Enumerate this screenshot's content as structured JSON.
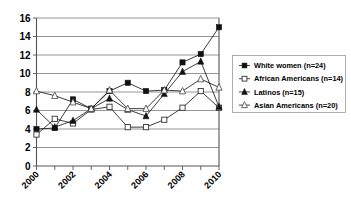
{
  "chart_data": {
    "type": "line",
    "title": "",
    "xlabel": "",
    "ylabel": "",
    "xlim": [
      2000,
      2010
    ],
    "ylim": [
      0,
      16
    ],
    "ytick_values": [
      0,
      2,
      4,
      6,
      8,
      10,
      12,
      14,
      16
    ],
    "ytick_labels": [
      "0",
      "2",
      "4",
      "6",
      "8",
      "10",
      "12",
      "14",
      "16"
    ],
    "x": [
      2000,
      2001,
      2002,
      2003,
      2004,
      2005,
      2006,
      2007,
      2008,
      2009,
      2010
    ],
    "xtick_labels": [
      "2000",
      "2002",
      "2004",
      "2006",
      "2008",
      "2010"
    ],
    "xtick_label_values": [
      2000,
      2002,
      2004,
      2006,
      2008,
      2010
    ],
    "grid": true,
    "legend_position": "right",
    "series": [
      {
        "name": "White women (n=24)",
        "marker": "filled-square",
        "values": [
          4.0,
          4.1,
          7.2,
          6.2,
          8.1,
          9.0,
          8.1,
          8.2,
          11.2,
          12.1,
          15.0
        ]
      },
      {
        "name": "African Americans (n=14)",
        "marker": "open-circle",
        "values": [
          3.4,
          5.1,
          4.6,
          6.1,
          6.4,
          4.2,
          4.2,
          5.0,
          6.3,
          8.1,
          6.3
        ]
      },
      {
        "name": "Latinos (n=15)",
        "marker": "filled-triangle",
        "values": [
          6.1,
          4.2,
          4.9,
          6.2,
          7.3,
          6.1,
          5.4,
          7.8,
          10.2,
          11.3,
          6.4
        ]
      },
      {
        "name": "Asian Americans (n=20)",
        "marker": "open-triangle",
        "values": [
          8.1,
          7.6,
          6.9,
          6.2,
          8.2,
          6.2,
          6.2,
          8.2,
          8.1,
          9.4,
          8.5
        ]
      }
    ]
  },
  "legend": {
    "entries": [
      "White women (n=24)",
      "African Americans (n=14)",
      "Latinos (n=15)",
      "Asian Americans (n=20)"
    ]
  }
}
